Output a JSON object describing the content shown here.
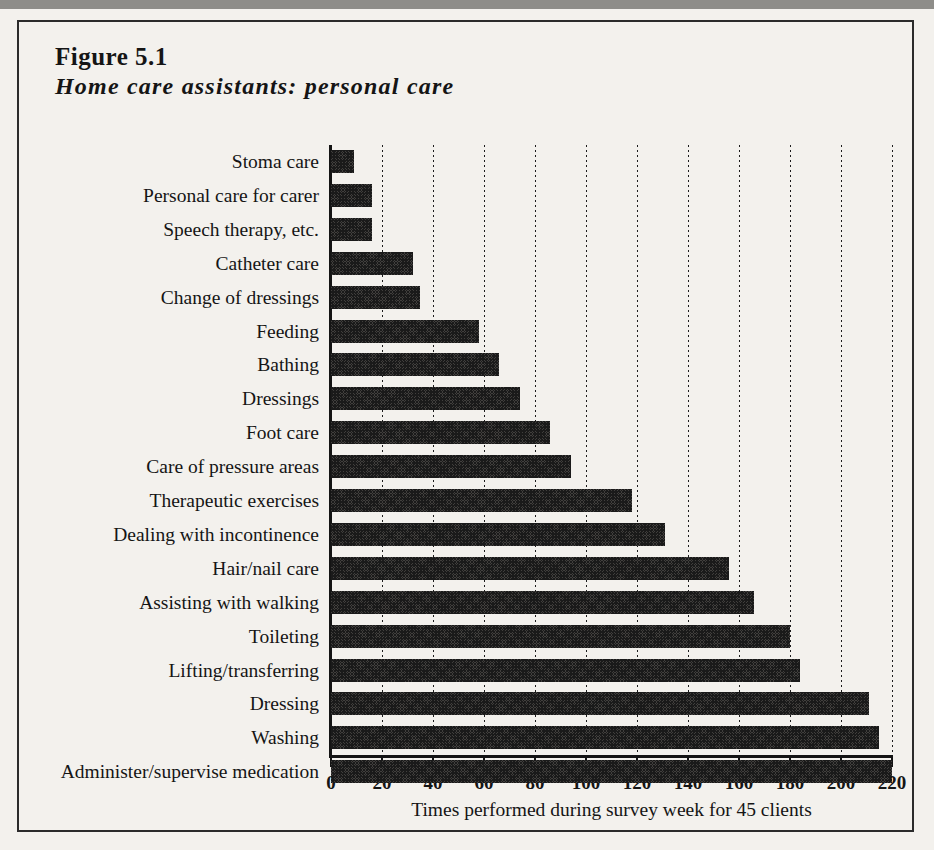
{
  "figure": {
    "number": "Figure 5.1",
    "title": "Home care assistants: personal care"
  },
  "chart_data": {
    "type": "bar",
    "orientation": "horizontal",
    "title": "Home care assistants: personal care",
    "subtitle": "Figure 5.1",
    "xlabel": "Times performed during survey week for 45 clients",
    "ylabel": "",
    "xlim": [
      0,
      220
    ],
    "xticks": [
      0,
      20,
      40,
      60,
      80,
      100,
      120,
      140,
      160,
      180,
      200,
      220
    ],
    "xtick_labels": [
      "0",
      "20",
      "40",
      "60",
      "80",
      "100",
      "120",
      "140",
      "160",
      "180",
      "200",
      "220"
    ],
    "grid": "vertical-dotted",
    "legend": "none",
    "bar_fill": "#413f3d",
    "bar_pattern": "dithered-checker",
    "axis_color": "#141414",
    "background": "#f3f1ed",
    "categories": [
      "Stoma care",
      "Personal care for carer",
      "Speech therapy, etc.",
      "Catheter care",
      "Change of dressings",
      "Feeding",
      "Bathing",
      "Dressings",
      "Foot care",
      "Care of pressure areas",
      "Therapeutic exercises",
      "Dealing with incontinence",
      "Hair/nail care",
      "Assisting with walking",
      "Toileting",
      "Lifting/transferring",
      "Dressing",
      "Washing",
      "Administer/supervise medication"
    ],
    "values": [
      9,
      16,
      16,
      32,
      35,
      58,
      66,
      74,
      86,
      94,
      118,
      131,
      156,
      166,
      180,
      184,
      211,
      215,
      220
    ]
  }
}
